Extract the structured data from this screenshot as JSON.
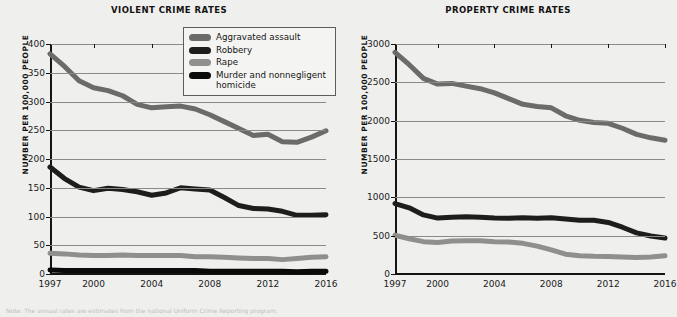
{
  "footnote": "Note: The annual rates are estimates from the national Uniform Crime Reporting program.",
  "axis": {
    "ylabel": "NUMBER PER 100,000 PEOPLE",
    "xticks": [
      "1997",
      "2000",
      "2004",
      "2008",
      "2012",
      "2016"
    ]
  },
  "colors": {
    "aggravated_assault": "#6b6b69",
    "robbery": "#1d1d1b",
    "rape": "#8f8f8d",
    "murder": "#0a0a0a",
    "larceny_theft": "#6b6b69",
    "burglary": "#1d1d1b",
    "motor_vehicle_theft": "#8f8f8d",
    "gridline": "#8a8a88",
    "axis": "#141414",
    "background": "#efefed",
    "legend_background": "#f4f4f2"
  },
  "chart_data": [
    {
      "type": "line",
      "title": "VIOLENT CRIME RATES",
      "xlabel": "",
      "ylabel": "NUMBER PER 100,000 PEOPLE",
      "grid": true,
      "legend_position": "top-right",
      "xlim": [
        1997,
        2016
      ],
      "ylim": [
        0,
        400
      ],
      "yticks": [
        0,
        50,
        100,
        150,
        200,
        250,
        300,
        350,
        400
      ],
      "xticks": [
        1997,
        2000,
        2004,
        2008,
        2012,
        2016
      ],
      "x": [
        1997,
        1998,
        1999,
        2000,
        2001,
        2002,
        2003,
        2004,
        2005,
        2006,
        2007,
        2008,
        2009,
        2010,
        2011,
        2012,
        2013,
        2014,
        2015,
        2016
      ],
      "series": [
        {
          "name": "Aggravated assault",
          "color": "#6b6b69",
          "values": [
            383,
            361,
            336,
            324,
            319,
            310,
            295,
            289,
            291,
            292,
            287,
            277,
            265,
            253,
            241,
            243,
            230,
            229,
            238,
            249
          ]
        },
        {
          "name": "Robbery",
          "color": "#1d1d1b",
          "values": [
            186,
            166,
            151,
            145,
            149,
            147,
            143,
            137,
            141,
            150,
            148,
            146,
            133,
            119,
            114,
            113,
            109,
            102,
            102,
            103
          ]
        },
        {
          "name": "Rape",
          "color": "#8f8f8d",
          "values": [
            36,
            35,
            33,
            32,
            32,
            33,
            32,
            32,
            32,
            32,
            30,
            30,
            29,
            28,
            27,
            27,
            25,
            27,
            29,
            30
          ]
        },
        {
          "name": "Murder and nonnegligent homicide",
          "color": "#0a0a0a",
          "values": [
            7,
            6,
            6,
            6,
            6,
            6,
            6,
            6,
            6,
            6,
            6,
            5,
            5,
            5,
            5,
            5,
            5,
            4,
            5,
            5
          ]
        }
      ]
    },
    {
      "type": "line",
      "title": "PROPERTY CRIME RATES",
      "xlabel": "",
      "ylabel": "NUMBER PER 100,000 PEOPLE",
      "grid": true,
      "legend_position": "top-right",
      "xlim": [
        1997,
        2016
      ],
      "ylim": [
        0,
        3000
      ],
      "yticks": [
        0,
        500,
        1000,
        1500,
        2000,
        2500,
        3000
      ],
      "xticks": [
        1997,
        2000,
        2004,
        2008,
        2012,
        2016
      ],
      "x": [
        1997,
        1998,
        1999,
        2000,
        2001,
        2002,
        2003,
        2004,
        2005,
        2006,
        2007,
        2008,
        2009,
        2010,
        2011,
        2012,
        2013,
        2014,
        2015,
        2016
      ],
      "series": [
        {
          "name": "Larceny-theft",
          "color": "#6b6b69",
          "values": [
            2892,
            2730,
            2551,
            2477,
            2486,
            2451,
            2417,
            2362,
            2287,
            2213,
            2186,
            2167,
            2064,
            2005,
            1976,
            1965,
            1901,
            1821,
            1776,
            1745
          ]
        },
        {
          "name": "Burglary",
          "color": "#1d1d1b",
          "values": [
            919,
            863,
            771,
            729,
            741,
            747,
            741,
            730,
            727,
            733,
            726,
            733,
            718,
            701,
            702,
            672,
            610,
            537,
            495,
            469
          ]
        },
        {
          "name": "Motor vehicle theft",
          "color": "#8f8f8d",
          "values": [
            506,
            460,
            422,
            412,
            431,
            433,
            433,
            422,
            417,
            400,
            364,
            315,
            259,
            239,
            230,
            229,
            222,
            216,
            222,
            237
          ]
        }
      ]
    }
  ],
  "panels": [
    {
      "title": "VIOLENT CRIME RATES",
      "legend": [
        {
          "label": "Aggravated assault",
          "color": "#6b6b69"
        },
        {
          "label": "Robbery",
          "color": "#1d1d1b"
        },
        {
          "label": "Rape",
          "color": "#8f8f8d"
        },
        {
          "label": "Murder and nonnegligent homicide",
          "color": "#0a0a0a"
        }
      ]
    },
    {
      "title": "PROPERTY CRIME RATES",
      "legend": [
        {
          "label": "Larceny-theft",
          "color": "#6b6b69"
        },
        {
          "label": "Burglary",
          "color": "#1d1d1b"
        },
        {
          "label": "Motor vehicle theft",
          "color": "#8f8f8d"
        }
      ]
    }
  ]
}
